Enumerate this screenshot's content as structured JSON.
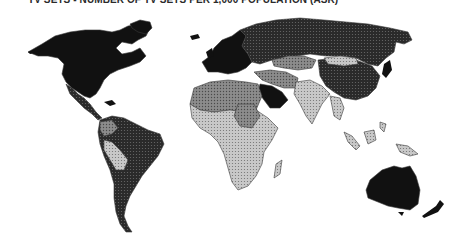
{
  "map": {
    "title": "TV SETS - NUMBER OF TV SETS PER 1,000 POPULATION (ASR)",
    "type": "choropleth world map",
    "classes": [
      {
        "level": "highest",
        "color": "#111111"
      },
      {
        "level": "high",
        "color": "#3a3a3a"
      },
      {
        "level": "medium",
        "color": "#8a8a8a"
      },
      {
        "level": "low",
        "color": "#bdbdbd"
      }
    ],
    "regions": [
      {
        "name": "North America",
        "class": "highest"
      },
      {
        "name": "Greenland",
        "class": "highest"
      },
      {
        "name": "Western Europe",
        "class": "highest"
      },
      {
        "name": "Eastern Europe / USSR",
        "class": "high"
      },
      {
        "name": "Mexico / Central America",
        "class": "high"
      },
      {
        "name": "South America (Brazil, Argentina, Venezuela, Colombia)",
        "class": "high"
      },
      {
        "name": "Bolivia / Peru",
        "class": "low"
      },
      {
        "name": "North Africa",
        "class": "medium"
      },
      {
        "name": "Sub-Saharan Africa",
        "class": "low"
      },
      {
        "name": "Saudi Arabia / Gulf",
        "class": "highest"
      },
      {
        "name": "Iran / Central Asia",
        "class": "medium"
      },
      {
        "name": "India / South Asia",
        "class": "low"
      },
      {
        "name": "China",
        "class": "high"
      },
      {
        "name": "Mongolia",
        "class": "low"
      },
      {
        "name": "Japan",
        "class": "highest"
      },
      {
        "name": "Southeast Asia / Indonesia",
        "class": "low"
      },
      {
        "name": "Australia",
        "class": "highest"
      },
      {
        "name": "New Zealand",
        "class": "highest"
      }
    ]
  }
}
